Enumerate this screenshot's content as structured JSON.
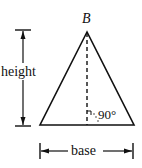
{
  "diagram": {
    "apex_label": "B",
    "height_label": "height",
    "base_label": "base",
    "angle_label": "90°",
    "stroke_color": "#111111",
    "background": "#ffffff"
  }
}
